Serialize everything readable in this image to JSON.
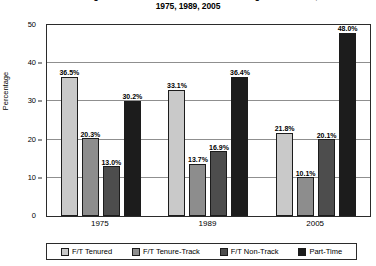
{
  "chart_data": {
    "type": "bar",
    "title": "Percentage Distribution of Instructional Staff in Higher Education,\n1975, 1989, 2005",
    "title_lines": [
      "Percentage Distribution of Instructional Staff in Higher Education,",
      "1975, 1989, 2005"
    ],
    "xlabel": "",
    "ylabel": "Percentage",
    "ylim": [
      0,
      50
    ],
    "yticks": [
      0,
      10,
      20,
      30,
      40,
      50
    ],
    "ytick_labels": [
      "0",
      "10",
      "20",
      "30",
      "40",
      "50"
    ],
    "grid": true,
    "legend_position": "bottom",
    "categories": [
      "1975",
      "1989",
      "2005"
    ],
    "series": [
      {
        "name": "F/T Tenured",
        "color": "#c9c9c9",
        "values": [
          36.5,
          33.1,
          21.8
        ],
        "labels": [
          "36.5%",
          "33.1%",
          "21.8%"
        ]
      },
      {
        "name": "F/T Tenure-Track",
        "color": "#8d8d8d",
        "values": [
          20.3,
          13.7,
          10.1
        ],
        "labels": [
          "20.3%",
          "13.7%",
          "10.1%"
        ]
      },
      {
        "name": "F/T Non-Track",
        "color": "#4d4d4d",
        "values": [
          13.0,
          16.9,
          20.1
        ],
        "labels": [
          "13.0%",
          "16.9%",
          "20.1%"
        ]
      },
      {
        "name": "Part-Time",
        "color": "#1c1c1c",
        "values": [
          30.2,
          36.4,
          48.0
        ],
        "labels": [
          "30.2%",
          "36.4%",
          "48.0%"
        ]
      }
    ]
  },
  "legend": {
    "items": [
      {
        "label": "F/T Tenured",
        "color": "#c9c9c9"
      },
      {
        "label": "F/T Tenure-Track",
        "color": "#8d8d8d"
      },
      {
        "label": "F/T Non-Track",
        "color": "#4d4d4d"
      },
      {
        "label": "Part-Time",
        "color": "#1c1c1c"
      }
    ]
  }
}
